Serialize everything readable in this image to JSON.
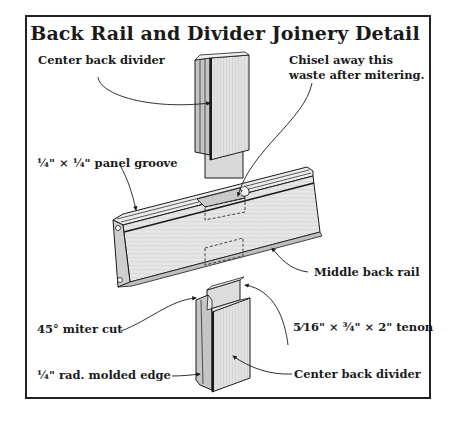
{
  "title": "Back Rail and Divider Joinery Detail",
  "labels": {
    "center_back_divider_top": "Center back divider",
    "chisel_line1": "Chisel away this",
    "chisel_line2": "waste after mitering.",
    "panel_groove": "¼\" × ¼\" panel groove",
    "middle_back_rail": "Middle back rail",
    "miter_cut": "45° miter cut",
    "tenon": "5⁄16\" × ¾\" × 2\" tenon",
    "molded_edge": "¼\" rad. molded edge",
    "center_back_divider_bottom": "Center back divider"
  },
  "colors": {
    "line": "#1a1a1a",
    "wood_light": "#e9e9e9",
    "wood_mid": "#d2d2d2",
    "wood_dark": "#b8b8b8",
    "frame": "#222222"
  },
  "parts": [
    {
      "name": "Center back divider (top)",
      "type": "divider"
    },
    {
      "name": "Middle back rail",
      "type": "rail"
    },
    {
      "name": "Center back divider (bottom)",
      "type": "divider"
    }
  ]
}
